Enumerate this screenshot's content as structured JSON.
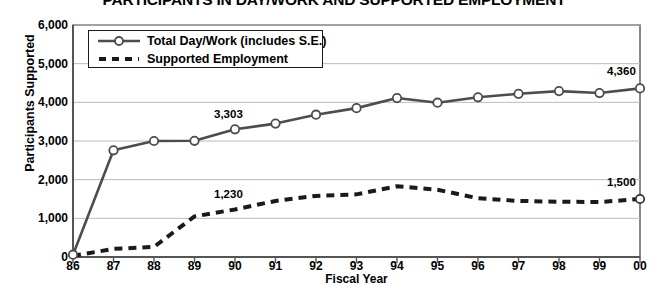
{
  "chart_data": {
    "type": "line",
    "title": "PARTICIPANTS IN DAY/WORK AND SUPPORTED EMPLOYMENT",
    "xlabel": "Fiscal Year",
    "ylabel": "Participants Supported",
    "categories": [
      "86",
      "87",
      "88",
      "89",
      "90",
      "91",
      "92",
      "93",
      "94",
      "95",
      "96",
      "97",
      "98",
      "99",
      "00"
    ],
    "ylim": [
      0,
      6000
    ],
    "yticks": [
      0,
      1000,
      2000,
      3000,
      4000,
      5000,
      6000
    ],
    "ytick_labels": [
      "0",
      "1,000",
      "2,000",
      "3,000",
      "4,000",
      "5,000",
      "6,000"
    ],
    "grid": true,
    "legend_position": "top-left",
    "series": [
      {
        "name": "Total Day/Work (includes S.E.)",
        "style": "solid-with-markers",
        "color": "#4d4d4d",
        "values": [
          60,
          2760,
          3000,
          3005,
          3303,
          3450,
          3680,
          3850,
          4110,
          3990,
          4130,
          4220,
          4290,
          4240,
          4360
        ]
      },
      {
        "name": "Supported Employment",
        "style": "dashed",
        "color": "#1a1a1a",
        "values": [
          30,
          210,
          260,
          1050,
          1230,
          1450,
          1580,
          1620,
          1830,
          1740,
          1520,
          1450,
          1430,
          1420,
          1500
        ]
      }
    ],
    "annotations": [
      {
        "text": "3,303",
        "series": 0,
        "category": "90"
      },
      {
        "text": "4,360",
        "series": 0,
        "category": "00"
      },
      {
        "text": "1,230",
        "series": 1,
        "category": "90"
      },
      {
        "text": "1,500",
        "series": 1,
        "category": "00"
      }
    ]
  }
}
